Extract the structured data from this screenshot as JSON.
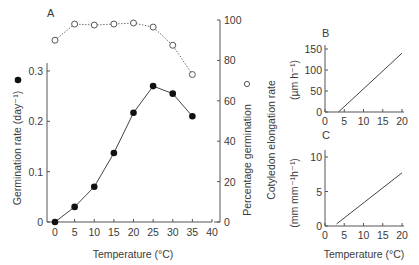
{
  "chart_data": [
    {
      "panel": "A",
      "type": "line",
      "title": "",
      "xlabel": "Temperature (°C)",
      "x": [
        0,
        5,
        10,
        15,
        20,
        25,
        30,
        35
      ],
      "xticks": [
        0,
        5,
        10,
        15,
        20,
        25,
        30,
        35,
        40
      ],
      "xlim": [
        0,
        40
      ],
      "ylabel_left": "Germination rate (day⁻¹)",
      "ylabel_left_marker": "●",
      "yticks_left": [
        "0",
        "0.1",
        "0.2",
        "0.3"
      ],
      "ylim_left": [
        0,
        0.3
      ],
      "ylabel_right": "Percentage germination",
      "ylabel_right_marker": "○",
      "yticks_right": [
        "0",
        "20",
        "40",
        "60",
        "80",
        "100"
      ],
      "ylim_right": [
        0,
        100
      ],
      "grid": false,
      "series": [
        {
          "name": "Germination rate",
          "axis": "left",
          "marker": "filled-circle",
          "line": "solid",
          "values": [
            0.0,
            0.03,
            0.07,
            0.137,
            0.217,
            0.27,
            0.255,
            0.21
          ]
        },
        {
          "name": "Percentage germination",
          "axis": "right",
          "marker": "open-circle",
          "line": "dotted",
          "values": [
            90,
            98,
            97.5,
            98,
            98.5,
            96.5,
            87.5,
            73
          ]
        }
      ]
    },
    {
      "panel": "B",
      "type": "line",
      "xlabel": "",
      "ylabel": "(µm h⁻¹)",
      "x": [
        3.5,
        20
      ],
      "xticks": [
        0,
        5,
        10,
        15,
        20
      ],
      "yticks": [
        "0",
        "50",
        "100",
        "150"
      ],
      "ylim": [
        0,
        150
      ],
      "series": [
        {
          "name": "Cotyledon elongation rate",
          "values": [
            0,
            140
          ]
        }
      ]
    },
    {
      "panel": "C",
      "type": "line",
      "xlabel": "Temperature (°C)",
      "ylabel": "(mm mm⁻¹h⁻¹)",
      "x": [
        3,
        20
      ],
      "xticks": [
        0,
        5,
        10,
        15,
        20
      ],
      "yticks": [
        "0",
        "5",
        "10"
      ],
      "ylim": [
        0,
        10
      ],
      "series": [
        {
          "name": "Cotyledon elongation rate",
          "values": [
            0.3,
            7.7
          ]
        }
      ]
    }
  ],
  "labels": {
    "panel_a": "A",
    "panel_b": "B",
    "panel_c": "C",
    "shared_bc_ylabel": "Cotyledon elongation rate",
    "xlabel_a": "Temperature (°C)",
    "xlabel_c": "Temperature (°C)"
  },
  "colors": {
    "axis": "#555555",
    "text": "#3a3a3a",
    "marker_fill": "#111111",
    "open_marker_stroke": "#555555"
  }
}
